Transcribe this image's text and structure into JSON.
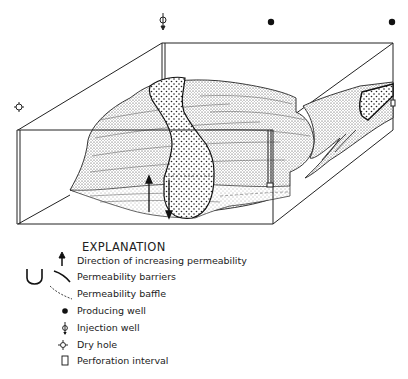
{
  "diagram": {
    "wells_top": [
      {
        "type": "injection-well",
        "x": 162,
        "y": 20
      },
      {
        "type": "producing-well",
        "x": 271,
        "y": 22
      },
      {
        "type": "producing-well",
        "x": 392,
        "y": 22
      },
      {
        "type": "dry-hole",
        "x": 19,
        "y": 107
      }
    ]
  },
  "legend": {
    "title": "EXPLANATION",
    "items": [
      {
        "symbol": "arrow-up",
        "label": "Direction of increasing permeability"
      },
      {
        "symbol": "barrier-curves",
        "label": "Permeability barriers"
      },
      {
        "symbol": "dashed-curve",
        "label": "Permeability baffle"
      },
      {
        "symbol": "filled-circle",
        "label": "Producing well"
      },
      {
        "symbol": "injection-well",
        "label": "Injection well"
      },
      {
        "symbol": "dry-hole",
        "label": "Dry hole"
      },
      {
        "symbol": "rectangle",
        "label": "Perforation interval"
      }
    ]
  }
}
